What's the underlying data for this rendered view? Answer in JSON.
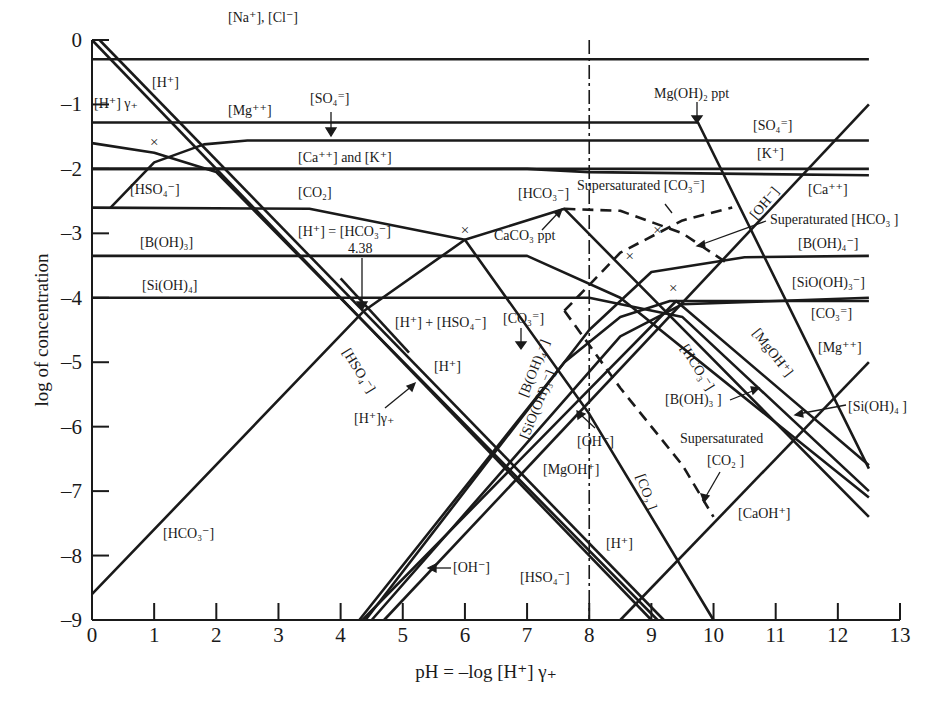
{
  "chart_data": {
    "type": "line",
    "title": "",
    "xlabel": "pH = –log [H⁺] γ₊",
    "ylabel": "log of concentration",
    "xlim": [
      0,
      13
    ],
    "ylim": [
      -9,
      0
    ],
    "x_ticks": [
      "0",
      "1",
      "2",
      "3",
      "4",
      "5",
      "6",
      "7",
      "8",
      "9",
      "10",
      "11",
      "12",
      "13"
    ],
    "y_ticks": [
      "0",
      "-1",
      "-2",
      "-3",
      "-4",
      "-5",
      "-6",
      "-7",
      "-8",
      "-9"
    ],
    "grid": false,
    "legend": "none (curves labelled inline)",
    "reference_line": {
      "x": 8.0,
      "style": "dash-dot",
      "label": ""
    },
    "series": [
      {
        "name": "[Na⁺], [Cl⁻]",
        "style": "solid",
        "x": [
          0,
          12.5
        ],
        "y": [
          -0.3,
          -0.3
        ]
      },
      {
        "name": "[Mg⁺⁺]",
        "style": "solid",
        "x": [
          0,
          9.75,
          12.5
        ],
        "y": [
          -1.28,
          -1.28,
          -6.65
        ]
      },
      {
        "name": "[SO₄⁼]",
        "style": "solid",
        "x": [
          0.3,
          1.0,
          1.8,
          2.5,
          12.5
        ],
        "y": [
          -2.6,
          -1.9,
          -1.62,
          -1.56,
          -1.56
        ]
      },
      {
        "name": "[Ca⁺⁺]",
        "style": "solid",
        "x": [
          0,
          7.0,
          8.0,
          12.5
        ],
        "y": [
          -2.0,
          -2.0,
          -2.05,
          -2.1
        ]
      },
      {
        "name": "[K⁺]",
        "style": "solid",
        "x": [
          0,
          12.5
        ],
        "y": [
          -2.0,
          -2.0
        ]
      },
      {
        "name": "[HSO₄⁻]",
        "style": "solid",
        "x": [
          0,
          1.0,
          2.0,
          9.1
        ],
        "y": [
          -1.6,
          -1.75,
          -2.05,
          -9.0
        ]
      },
      {
        "name": "[H⁺]",
        "style": "solid",
        "x": [
          0,
          9.0
        ],
        "y": [
          0,
          -9.0
        ]
      },
      {
        "name": "[H⁺] γ₊",
        "style": "solid",
        "x": [
          0.12,
          9.2
        ],
        "y": [
          0,
          -9.0
        ]
      },
      {
        "name": "[CO₂]",
        "style": "solid",
        "x": [
          0,
          3.5,
          6.0,
          8.0,
          10.0
        ],
        "y": [
          -2.6,
          -2.62,
          -3.1,
          -5.8,
          -9.0
        ]
      },
      {
        "name": "[HCO₃⁻]",
        "style": "solid",
        "x": [
          0,
          4.38,
          6.0,
          7.6,
          8.5,
          12.5
        ],
        "y": [
          -8.6,
          -4.2,
          -3.1,
          -2.62,
          -3.5,
          -7.4
        ]
      },
      {
        "name": "[CO₃⁼]",
        "style": "solid",
        "x": [
          4.3,
          7.6,
          8.5,
          9.3,
          12.5
        ],
        "y": [
          -9.0,
          -5.0,
          -4.3,
          -4.05,
          -4.05
        ]
      },
      {
        "name": "[B(OH)₃]",
        "style": "solid",
        "x": [
          0,
          7.0,
          8.5,
          12.5
        ],
        "y": [
          -3.35,
          -3.35,
          -4.0,
          -7.1
        ]
      },
      {
        "name": "[B(OH)₄⁻]",
        "style": "solid",
        "x": [
          4.4,
          8.0,
          9.0,
          10.5,
          12.5
        ],
        "y": [
          -9.0,
          -4.5,
          -3.6,
          -3.37,
          -3.35
        ]
      },
      {
        "name": "[Si(OH)₄]",
        "style": "solid",
        "x": [
          0,
          8.0,
          9.5,
          12.5
        ],
        "y": [
          -4.0,
          -4.0,
          -4.3,
          -7.0
        ]
      },
      {
        "name": "[SiO(OH)₃⁻]",
        "style": "solid",
        "x": [
          4.5,
          8.5,
          9.5,
          12.5
        ],
        "y": [
          -9.0,
          -4.6,
          -4.1,
          -4.0
        ]
      },
      {
        "name": "[OH⁻]",
        "style": "solid",
        "x": [
          4.7,
          12.5
        ],
        "y": [
          -9.0,
          -1.0
        ]
      },
      {
        "name": "[MgOH⁺]",
        "style": "solid",
        "x": [
          4.35,
          9.4,
          12.5
        ],
        "y": [
          -9.0,
          -4.05,
          -6.6
        ]
      },
      {
        "name": "[CaOH⁺]",
        "style": "solid",
        "x": [
          8.5,
          12.5
        ],
        "y": [
          -9.0,
          -5.0
        ]
      },
      {
        "name": "[H⁺] + [HSO₄⁻]",
        "style": "solid",
        "x": [
          4.0,
          5.1
        ],
        "y": [
          -3.7,
          -4.85
        ]
      },
      {
        "name": "Supersaturated [CO₃⁼]",
        "style": "dashed",
        "x": [
          7.6,
          8.5,
          9.5,
          10.3
        ],
        "y": [
          -4.2,
          -3.3,
          -2.8,
          -2.6
        ]
      },
      {
        "name": "Supersaturated [HCO₃⁻]",
        "style": "dashed",
        "x": [
          7.6,
          8.5,
          9.5,
          10.2
        ],
        "y": [
          -2.62,
          -2.65,
          -3.0,
          -3.45
        ]
      },
      {
        "name": "Supersaturated [CO₂]",
        "style": "dashed",
        "x": [
          7.6,
          8.5,
          9.5,
          10.0
        ],
        "y": [
          -4.2,
          -5.4,
          -6.6,
          -7.4
        ]
      }
    ],
    "annotations": [
      {
        "text": "4.38",
        "x": 4.38,
        "y": -3.1,
        "note": "[H⁺] = [HCO₃⁻] at pH 4.38"
      },
      {
        "text": "Mg(OH)₂ ppt",
        "x": 9.75,
        "y": -1.28
      },
      {
        "text": "CaCO₃ ppt",
        "x": 7.6,
        "y": -2.62
      },
      {
        "text": "×",
        "x": 1.0,
        "y": -1.58
      },
      {
        "text": "×",
        "x": 6.0,
        "y": -2.95
      },
      {
        "text": "×",
        "x": 9.1,
        "y": -2.95
      },
      {
        "text": "×",
        "x": 8.65,
        "y": -3.35
      },
      {
        "text": "×",
        "x": 9.35,
        "y": -3.85
      }
    ]
  },
  "labels": {
    "na_cl": "[Na⁺], [Cl⁻]",
    "h_top": "[H⁺]",
    "h_gamma_top": "[H⁺] γ₊",
    "mg": "[Mg⁺⁺]",
    "so4_top": "[SO₄⁼]",
    "ca_k": "[Ca⁺⁺] and [K⁺]",
    "hso4_top": "[HSO₄⁻]",
    "co2_top": "[CO₂]",
    "h_eq_hco3": "[H⁺] = [HCO₃⁻]",
    "pt_438": "4.38",
    "boh3_left": "[B(OH)₃]",
    "sioh4_left": "[Si(OH)₄]",
    "hco3_top": "[HCO₃⁻]",
    "caco3_ppt": "CaCO₃ ppt",
    "supersat_co3": "Supersaturated [CO₃⁼]",
    "mgoh2_ppt": "Mg(OH)₂ ppt",
    "so4_right": "[SO₄⁼]",
    "k_right": "[K⁺]",
    "ca_right": "[Ca⁺⁺]",
    "oh_diag": "[OH⁻]",
    "supersat_hco3": "Superaturated [HCO₃ ]",
    "boh4_right": "[B(OH)₄⁻]",
    "sioh3_right": "[SiO(OH)₃⁻]",
    "co3_right": "[CO₃⁼]",
    "mg_right": "[Mg⁺⁺]",
    "mgoh_diag": "[MgOH⁺]",
    "hco3_diag": "[HCO₃⁻]",
    "boh3_right": "[B(OH)₃ ]",
    "sioh4_right": "[Si(OH)₄ ]",
    "supersat_co2_1": "Supersaturated",
    "supersat_co2_2": "[CO₂ ]",
    "caoh": "[CaOH⁺]",
    "h_plus_hso4": "[H⁺] + [HSO₄⁻]",
    "co3_mid": "[CO₃⁼]",
    "h_mid": "[H⁺]",
    "hso4_diag": "[HSO₄⁻]",
    "h_gamma_mid": "[H⁺]γ₊",
    "boh4_diag": "[B(OH)₄⁻]",
    "sioh3_diag": "[SiO(OH)₃⁻]",
    "oh_mid": "[OH⁻]",
    "mgoh_mid": "[MgOH⁺]",
    "co2_diag": "[CO₂ ]",
    "h_low": "[H⁺]",
    "hso4_low": "[HSO₄⁻]",
    "oh_low": "[OH⁻]",
    "hco3_low": "[HCO₃⁻]",
    "x_axis_title": "pH = –log [H⁺] γ₊",
    "y_axis_title": "log of concentration"
  },
  "colors": {
    "ink": "#1a1a1a",
    "background": "#ffffff"
  }
}
